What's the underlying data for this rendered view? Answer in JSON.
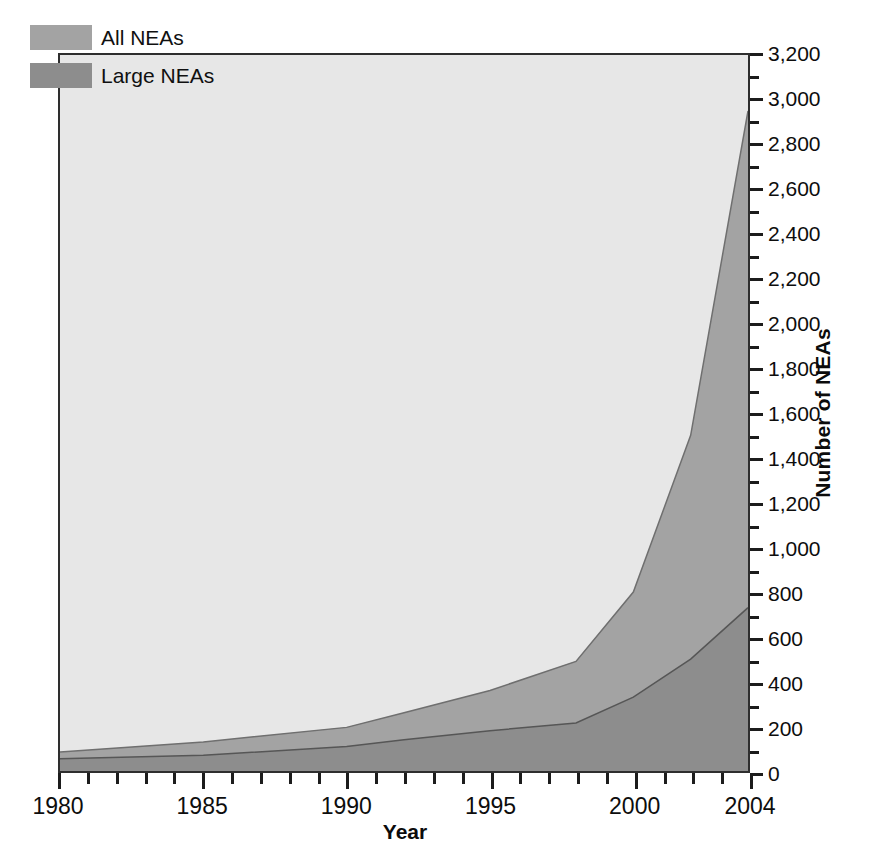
{
  "chart_data": {
    "type": "area",
    "title": "",
    "subtitle": "",
    "xlabel": "Year",
    "ylabel": "Number of NEAs",
    "xlim": [
      1980,
      2004
    ],
    "ylim": [
      0,
      3200
    ],
    "grid": false,
    "stacked": false,
    "legend_position": "top-left",
    "x": [
      1980,
      1985,
      1990,
      1992,
      1995,
      1998,
      2000,
      2002,
      2004
    ],
    "series": [
      {
        "name": "All NEAs",
        "color": "#a3a3a3",
        "values": [
          85,
          130,
          195,
          260,
          360,
          490,
          800,
          1500,
          2950
        ]
      },
      {
        "name": "Large NEAs",
        "color": "#8d8d8d",
        "values": [
          55,
          70,
          110,
          140,
          180,
          215,
          330,
          500,
          730
        ]
      }
    ],
    "x_tick_labels": [
      "1980",
      "1985",
      "1990",
      "1995",
      "2000",
      "2004"
    ],
    "x_tick_values": [
      1980,
      1985,
      1990,
      1995,
      2000,
      2004
    ],
    "x_minor_tick_step": 1,
    "y_tick_labels": [
      "0",
      "200",
      "400",
      "600",
      "800",
      "1,000",
      "1,200",
      "1,400",
      "1,600",
      "1,800",
      "2,000",
      "2,200",
      "2,400",
      "2,600",
      "2,800",
      "3,000",
      "3,200"
    ],
    "y_tick_values": [
      0,
      200,
      400,
      600,
      800,
      1000,
      1200,
      1400,
      1600,
      1800,
      2000,
      2200,
      2400,
      2600,
      2800,
      3000,
      3200
    ],
    "y_minor_tick_step": 100
  },
  "legend": {
    "items": [
      {
        "label": "All NEAs",
        "swatch": "all"
      },
      {
        "label": "Large NEAs",
        "swatch": "large"
      }
    ]
  },
  "axes": {
    "x_title": "Year",
    "y_title": "Number of NEAs"
  },
  "colors": {
    "plot_background": "#e7e7e7",
    "all_neas_fill": "#a3a3a3",
    "large_neas_fill": "#8d8d8d",
    "frame": "#2e2e2e",
    "text": "#0d0d0d"
  }
}
